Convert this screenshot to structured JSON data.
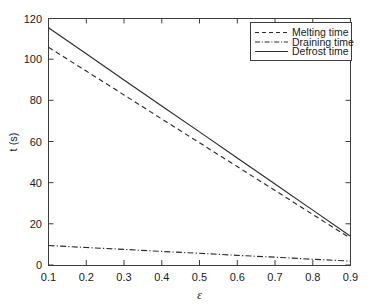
{
  "chart_data": {
    "type": "line",
    "title": "",
    "xlabel": "ε",
    "ylabel": "t (s)",
    "xlim": [
      0.1,
      0.9
    ],
    "ylim": [
      0,
      120
    ],
    "xticks": [
      "0.1",
      "0.2",
      "0.3",
      "0.4",
      "0.5",
      "0.6",
      "0.7",
      "0.8",
      "0.9"
    ],
    "xtick_values": [
      0.1,
      0.2,
      0.3,
      0.4,
      0.5,
      0.6,
      0.7,
      0.8,
      0.9
    ],
    "yticks": [
      "0",
      "20",
      "40",
      "60",
      "80",
      "100",
      "120"
    ],
    "ytick_values": [
      0,
      20,
      40,
      60,
      80,
      100,
      120
    ],
    "grid": false,
    "legend_position": "upper right",
    "x": [
      0.1,
      0.2,
      0.3,
      0.4,
      0.5,
      0.6,
      0.7,
      0.8,
      0.9
    ],
    "series": [
      {
        "name": "Melting time",
        "style": "dashed",
        "color": "#2b2b2b",
        "values": [
          106.0,
          94.4,
          82.8,
          71.1,
          59.5,
          47.9,
          36.3,
          24.6,
          13.0
        ]
      },
      {
        "name": "Draining time",
        "style": "dash-dot",
        "color": "#2b2b2b",
        "values": [
          9.5,
          8.5,
          7.6,
          6.6,
          5.7,
          4.7,
          3.8,
          2.8,
          1.9
        ]
      },
      {
        "name": "Defrost time",
        "style": "solid",
        "color": "#2b2b2b",
        "values": [
          115.5,
          102.8,
          90.1,
          77.4,
          64.8,
          52.1,
          39.4,
          26.7,
          14.0
        ]
      }
    ]
  },
  "legend": {
    "entries": [
      {
        "label": "Melting time"
      },
      {
        "label": "Draining time"
      },
      {
        "label": "Defrost time"
      }
    ]
  },
  "axes": {
    "y_title": "t (s)",
    "x_title": "ε"
  }
}
